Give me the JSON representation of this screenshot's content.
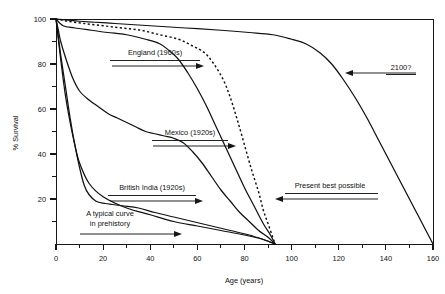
{
  "chart_data": {
    "type": "line",
    "title": "",
    "xlabel": "Age (years)",
    "ylabel": "% Survival",
    "xlim": [
      0,
      160
    ],
    "ylim": [
      0,
      100
    ],
    "grid": false,
    "legend_position": "none",
    "x_ticks_major": [
      0,
      20,
      40,
      60,
      80,
      100,
      120,
      140,
      160
    ],
    "x_tick_labels": [
      "0",
      "20",
      "40",
      "60",
      "80",
      "100",
      "120",
      "140",
      "160"
    ],
    "x_tick_minor_step": 10,
    "y_ticks_major": [
      20,
      40,
      60,
      80,
      100
    ],
    "y_tick_labels": [
      "20",
      "40",
      "60",
      "80",
      "100"
    ],
    "y_tick_minor_step": 10,
    "series": [
      {
        "name": "A typical curve in prehistory",
        "style": "solid",
        "points": [
          [
            0,
            100
          ],
          [
            2,
            82
          ],
          [
            4,
            66
          ],
          [
            6,
            54
          ],
          [
            8,
            44
          ],
          [
            10,
            36
          ],
          [
            14,
            27
          ],
          [
            20,
            21
          ],
          [
            30,
            16
          ],
          [
            40,
            13
          ],
          [
            50,
            10
          ],
          [
            60,
            8
          ],
          [
            70,
            6
          ],
          [
            80,
            4
          ],
          [
            88,
            2
          ],
          [
            93,
            0
          ]
        ]
      },
      {
        "name": "British India (1920s)",
        "style": "solid",
        "points": [
          [
            0,
            100
          ],
          [
            1,
            92
          ],
          [
            2,
            84
          ],
          [
            4,
            70
          ],
          [
            6,
            56
          ],
          [
            8,
            44
          ],
          [
            10,
            34
          ],
          [
            12,
            26
          ],
          [
            14,
            22
          ],
          [
            17,
            19
          ],
          [
            21,
            18
          ],
          [
            28,
            17
          ],
          [
            35,
            16
          ],
          [
            42,
            14
          ],
          [
            50,
            12
          ],
          [
            58,
            10
          ],
          [
            66,
            8
          ],
          [
            74,
            6
          ],
          [
            82,
            4
          ],
          [
            88,
            2
          ],
          [
            93,
            0
          ]
        ]
      },
      {
        "name": "Mexico (1920s)",
        "style": "solid",
        "points": [
          [
            0,
            100
          ],
          [
            1,
            95
          ],
          [
            2,
            90
          ],
          [
            4,
            83
          ],
          [
            7,
            74
          ],
          [
            10,
            68
          ],
          [
            14,
            64
          ],
          [
            18,
            61
          ],
          [
            22,
            58
          ],
          [
            26,
            56
          ],
          [
            30,
            54
          ],
          [
            34,
            52
          ],
          [
            38,
            50
          ],
          [
            42,
            49
          ],
          [
            46,
            48
          ],
          [
            50,
            47
          ],
          [
            54,
            45
          ],
          [
            58,
            41
          ],
          [
            62,
            36
          ],
          [
            66,
            30
          ],
          [
            70,
            24
          ],
          [
            74,
            19
          ],
          [
            78,
            14
          ],
          [
            82,
            10
          ],
          [
            86,
            6
          ],
          [
            90,
            3
          ],
          [
            93,
            0
          ]
        ]
      },
      {
        "name": "England (1960s)",
        "style": "solid",
        "points": [
          [
            0,
            100
          ],
          [
            3,
            97
          ],
          [
            8,
            96
          ],
          [
            15,
            95
          ],
          [
            22,
            94
          ],
          [
            30,
            93
          ],
          [
            38,
            91
          ],
          [
            44,
            89
          ],
          [
            48,
            86
          ],
          [
            52,
            82
          ],
          [
            56,
            76
          ],
          [
            60,
            69
          ],
          [
            64,
            61
          ],
          [
            68,
            52
          ],
          [
            72,
            43
          ],
          [
            76,
            34
          ],
          [
            80,
            25
          ],
          [
            84,
            17
          ],
          [
            88,
            9
          ],
          [
            91,
            4
          ],
          [
            93,
            0
          ]
        ]
      },
      {
        "name": "Present best possible",
        "style": "dashed",
        "points": [
          [
            0,
            100
          ],
          [
            5,
            99
          ],
          [
            12,
            98
          ],
          [
            20,
            97
          ],
          [
            28,
            96
          ],
          [
            36,
            95
          ],
          [
            44,
            93
          ],
          [
            52,
            91
          ],
          [
            58,
            88
          ],
          [
            63,
            85
          ],
          [
            67,
            80
          ],
          [
            71,
            73
          ],
          [
            74,
            65
          ],
          [
            77,
            55
          ],
          [
            80,
            44
          ],
          [
            83,
            33
          ],
          [
            86,
            23
          ],
          [
            88,
            15
          ],
          [
            90,
            9
          ],
          [
            92,
            3
          ],
          [
            93,
            0
          ]
        ]
      },
      {
        "name": "2100?",
        "style": "solid",
        "points": [
          [
            0,
            100
          ],
          [
            10,
            99
          ],
          [
            25,
            98
          ],
          [
            40,
            97
          ],
          [
            55,
            96
          ],
          [
            70,
            95
          ],
          [
            82,
            94
          ],
          [
            92,
            93
          ],
          [
            100,
            91
          ],
          [
            106,
            89
          ],
          [
            112,
            85
          ],
          [
            117,
            80
          ],
          [
            122,
            73
          ],
          [
            127,
            65
          ],
          [
            132,
            56
          ],
          [
            137,
            46
          ],
          [
            142,
            36
          ],
          [
            147,
            26
          ],
          [
            152,
            16
          ],
          [
            157,
            6
          ],
          [
            160,
            0
          ]
        ]
      }
    ],
    "annotations": [
      {
        "id": "england",
        "label": "England (1960s)",
        "arrow_direction": "right",
        "underline": true,
        "points_to_series": "England (1960s)"
      },
      {
        "id": "mexico",
        "label": "Mexico (1920s)",
        "arrow_direction": "right",
        "underline": true,
        "points_to_series": "Mexico (1920s)"
      },
      {
        "id": "british-india",
        "label": "British India (1920s)",
        "arrow_direction": "right",
        "underline": true,
        "points_to_series": "British India (1920s)"
      },
      {
        "id": "prehistory",
        "label_line1": "A typical curve",
        "label_line2": "in prehistory",
        "arrow_direction": "right",
        "underline": false,
        "points_to_series": "A typical curve in prehistory"
      },
      {
        "id": "present-best",
        "label": "Present best possible",
        "arrow_direction": "left",
        "underline": true,
        "points_to_series": "Present best possible"
      },
      {
        "id": "year-2100",
        "label": "2100?",
        "arrow_direction": "left",
        "underline": true,
        "points_to_series": "2100?"
      }
    ],
    "colors": {
      "curve": "#111111",
      "axis": "#161616",
      "background": "#ffffff"
    }
  }
}
